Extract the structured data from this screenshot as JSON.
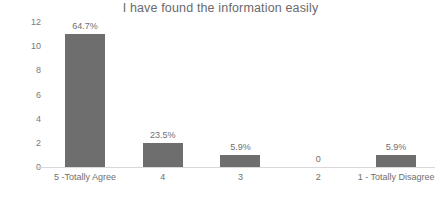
{
  "chart_data": {
    "type": "bar",
    "title": "I have found the information easily",
    "xlabel": "",
    "ylabel": "Number of Users",
    "categories": [
      "5 -Totally Agree",
      "4",
      "3",
      "2",
      "1 - Totally Disagree"
    ],
    "values": [
      11,
      2,
      1,
      0,
      1
    ],
    "data_labels": [
      "64.7%",
      "23.5%",
      "5.9%",
      "0",
      "5.9%"
    ],
    "ylim": [
      0,
      12
    ],
    "yticks": [
      12,
      10,
      8,
      6,
      4,
      2,
      0
    ],
    "grid": false,
    "legend": "none",
    "bar_color": "#6e6e6e",
    "text_color": "#6f6f6f",
    "axis_color": "#d8d8d8"
  }
}
